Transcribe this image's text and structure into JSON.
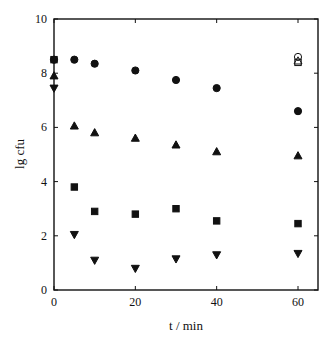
{
  "chart_data": {
    "type": "scatter",
    "title": "",
    "xlabel": "t / min",
    "ylabel": "lg cfu",
    "xlim": [
      0,
      64
    ],
    "ylim": [
      0,
      10
    ],
    "xticks": [
      0,
      20,
      40,
      60
    ],
    "yticks": [
      0,
      2,
      4,
      6,
      8,
      10
    ],
    "grid": false,
    "legend": null,
    "series": [
      {
        "name": "filled-circle",
        "marker": "circle",
        "filled": true,
        "x": [
          0,
          5,
          10,
          20,
          30,
          40,
          60
        ],
        "values": [
          8.5,
          8.5,
          8.35,
          8.1,
          7.75,
          7.45,
          6.6
        ]
      },
      {
        "name": "filled-triangle-up",
        "marker": "triangle-up",
        "filled": true,
        "x": [
          0,
          5,
          10,
          20,
          30,
          40,
          60
        ],
        "values": [
          7.9,
          6.05,
          5.8,
          5.6,
          5.35,
          5.1,
          4.95
        ]
      },
      {
        "name": "filled-square",
        "marker": "square",
        "filled": true,
        "x": [
          0,
          5,
          10,
          20,
          30,
          40,
          60
        ],
        "values": [
          8.5,
          3.8,
          2.9,
          2.8,
          3.0,
          2.55,
          2.45
        ]
      },
      {
        "name": "filled-triangle-down",
        "marker": "triangle-down",
        "filled": true,
        "x": [
          0,
          5,
          10,
          20,
          30,
          40,
          60
        ],
        "values": [
          7.45,
          2.05,
          1.1,
          0.8,
          1.15,
          1.3,
          1.35
        ]
      },
      {
        "name": "open-circle",
        "marker": "circle",
        "filled": false,
        "x": [
          60
        ],
        "values": [
          8.6
        ]
      },
      {
        "name": "open-triangle-up",
        "marker": "triangle-up",
        "filled": false,
        "x": [
          60
        ],
        "values": [
          8.45
        ]
      },
      {
        "name": "open-square",
        "marker": "square",
        "filled": false,
        "x": [
          60
        ],
        "values": [
          8.4
        ]
      }
    ]
  },
  "labels": {
    "xlabel": "t / min",
    "ylabel": "lg cfu"
  }
}
